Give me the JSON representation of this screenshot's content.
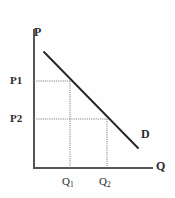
{
  "figure": {
    "kind": "economics-demand-curve-diagram",
    "background_color": "#fefefe",
    "ink_color": "#2b2b2b",
    "axis_color": "#555555",
    "curve_color": "#262626",
    "guide_color": "#7a7a7a"
  },
  "axes": {
    "y_label": "P",
    "x_label": "Q",
    "y_axis_x": 34,
    "y_axis_top": 30,
    "y_axis_bottom": 168,
    "x_axis_y": 168,
    "x_axis_left": 34,
    "x_axis_right": 152
  },
  "curve": {
    "label": "D",
    "start_x": 44,
    "start_y": 52,
    "end_x": 138,
    "end_y": 148
  },
  "price_levels": [
    {
      "label": "P1",
      "y": 81
    },
    {
      "label": "P2",
      "y": 119
    }
  ],
  "quantity_levels": [
    {
      "label": "Q",
      "subscript": "1",
      "x": 70
    },
    {
      "label": "Q",
      "subscript": "2",
      "x": 107
    }
  ],
  "guides": [
    {
      "name": "p1-horizontal-guide",
      "x1": 34,
      "y1": 81,
      "x2": 70,
      "y2": 81
    },
    {
      "name": "q1-vertical-guide",
      "x1": 70,
      "y1": 81,
      "x2": 70,
      "y2": 168
    },
    {
      "name": "p2-horizontal-guide",
      "x1": 34,
      "y1": 119,
      "x2": 107,
      "y2": 119
    },
    {
      "name": "q2-vertical-guide",
      "x1": 107,
      "y1": 119,
      "x2": 107,
      "y2": 168
    }
  ],
  "chart_data": {
    "type": "line",
    "title": "",
    "subtitle": "",
    "xlabel": "Q",
    "ylabel": "P",
    "grid": false,
    "legend_position": "inline-curve-end",
    "x_tick_labels": [
      "Q1",
      "Q2"
    ],
    "y_tick_labels": [
      "P1",
      "P2"
    ],
    "series": [
      {
        "name": "D",
        "description": "Downward sloping demand curve",
        "points": [
          {
            "x": "Q1",
            "y": "P1"
          },
          {
            "x": "Q2",
            "y": "P2"
          }
        ]
      }
    ],
    "annotations": [
      "Dotted guide lines connect P1 to Q1 on the demand curve",
      "Dotted guide lines connect P2 to Q2 on the demand curve",
      "Price falls from P1 to P2 while quantity demanded rises from Q1 to Q2"
    ]
  }
}
